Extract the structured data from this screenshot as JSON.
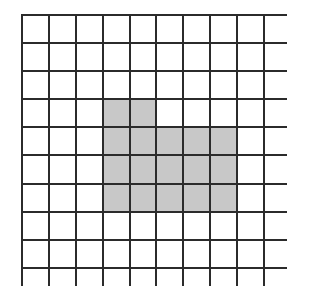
{
  "figure": {
    "type": "grid-diagram",
    "rows": 10,
    "cols": 10,
    "colors": {
      "background": "#ffffff",
      "grid_line": "#2b2b2b",
      "cell_empty": "#ffffff",
      "cell_shaded": "#c8c8c8"
    },
    "line_width_px": 2,
    "shaded_count": 17,
    "shaded_cells": [
      [
        4,
        4
      ],
      [
        4,
        5
      ],
      [
        5,
        4
      ],
      [
        5,
        5
      ],
      [
        5,
        6
      ],
      [
        5,
        7
      ],
      [
        5,
        8
      ],
      [
        6,
        4
      ],
      [
        6,
        5
      ],
      [
        6,
        6
      ],
      [
        6,
        7
      ],
      [
        6,
        8
      ],
      [
        7,
        4
      ],
      [
        7,
        5
      ],
      [
        7,
        6
      ],
      [
        7,
        7
      ],
      [
        7,
        8
      ]
    ],
    "cell_matrix": [
      [
        0,
        0,
        0,
        0,
        0,
        0,
        0,
        0,
        0,
        0
      ],
      [
        0,
        0,
        0,
        0,
        0,
        0,
        0,
        0,
        0,
        0
      ],
      [
        0,
        0,
        0,
        0,
        0,
        0,
        0,
        0,
        0,
        0
      ],
      [
        0,
        0,
        0,
        1,
        1,
        0,
        0,
        0,
        0,
        0
      ],
      [
        0,
        0,
        0,
        1,
        1,
        1,
        1,
        1,
        0,
        0
      ],
      [
        0,
        0,
        0,
        1,
        1,
        1,
        1,
        1,
        0,
        0
      ],
      [
        0,
        0,
        0,
        1,
        1,
        1,
        1,
        1,
        0,
        0
      ],
      [
        0,
        0,
        0,
        0,
        0,
        0,
        0,
        0,
        0,
        0
      ],
      [
        0,
        0,
        0,
        0,
        0,
        0,
        0,
        0,
        0,
        0
      ],
      [
        0,
        0,
        0,
        0,
        0,
        0,
        0,
        0,
        0,
        0
      ]
    ]
  }
}
